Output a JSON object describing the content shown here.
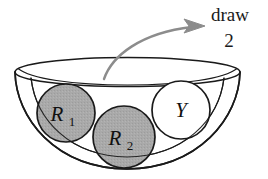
{
  "figure": {
    "annotation": {
      "line1": "draw",
      "line2": "2",
      "arrow_icon": "curved-arrow-icon",
      "arrow_color": "#8c8c8c"
    },
    "container": {
      "name": "bowl",
      "outline_color": "#1a1a1a",
      "fill_color": "#ffffff"
    },
    "balls": [
      {
        "id": "ball-r1",
        "label": "R",
        "subscript": "1",
        "fill": "#a9a9a9",
        "stroke": "#1a1a1a",
        "cx": 66,
        "cy": 113,
        "r": 29
      },
      {
        "id": "ball-r2",
        "label": "R",
        "subscript": "2",
        "fill": "#a9a9a9",
        "stroke": "#1a1a1a",
        "cx": 124,
        "cy": 137,
        "r": 31
      },
      {
        "id": "ball-y",
        "label": "Y",
        "subscript": "",
        "fill": "#ffffff",
        "stroke": "#1a1a1a",
        "cx": 181,
        "cy": 110,
        "r": 29
      }
    ]
  }
}
